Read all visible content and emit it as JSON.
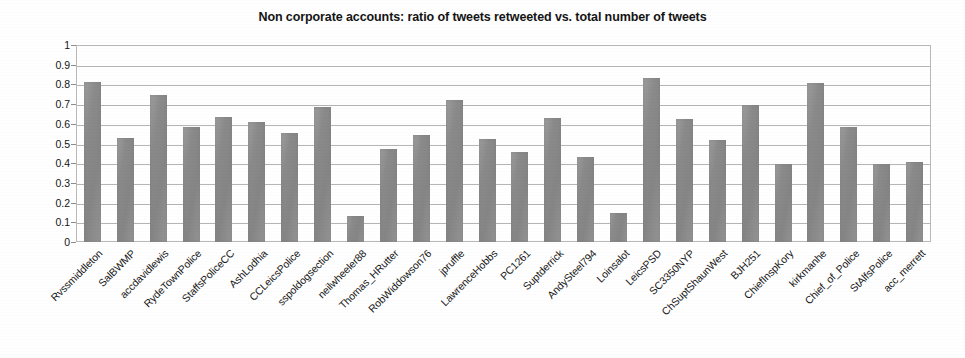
{
  "chart_data": {
    "type": "bar",
    "title": "Non corporate accounts: ratio of tweets retweeted vs. total number of tweets",
    "xlabel": "",
    "ylabel": "",
    "ylim": [
      0,
      1
    ],
    "ytick_labels": [
      "1",
      "0.9",
      "0.8",
      "0.7",
      "0.6",
      "0.5",
      "0.4",
      "0.3",
      "0.2",
      "0.1",
      "0"
    ],
    "ytick_values": [
      1,
      0.9,
      0.8,
      0.7,
      0.6,
      0.5,
      0.4,
      0.3,
      0.2,
      0.1,
      0
    ],
    "grid": true,
    "legend": null,
    "bar_color": "#8a8a8a",
    "categories": [
      "Rvssmiddleton",
      "SalBWMP",
      "accdavidlewis",
      "RydeTownPolice",
      "StaffsPoliceCC",
      "AshLodhia",
      "CCLeicsPolice",
      "sspoldogsection",
      "neilwheeler88",
      "Thomas_HRutter",
      "RobWiddowson76",
      "jpruffle",
      "LawrenceHobbs",
      "PC1261",
      "Suptderrick",
      "AndySteel794",
      "Loinsalot",
      "LeicsPSD",
      "SC3350NYP",
      "ChSuptShaunWest",
      "BJH251",
      "ChiefInspKory",
      "kirkmanhe",
      "Chief_of_Police",
      "StAlfsPolice",
      "acc_merrett"
    ],
    "values": [
      0.81,
      0.53,
      0.745,
      0.585,
      0.635,
      0.61,
      0.555,
      0.685,
      0.13,
      0.47,
      0.545,
      0.72,
      0.525,
      0.455,
      0.63,
      0.43,
      0.145,
      0.835,
      0.625,
      0.52,
      0.695,
      0.395,
      0.805,
      0.585,
      0.395,
      0.405
    ]
  }
}
